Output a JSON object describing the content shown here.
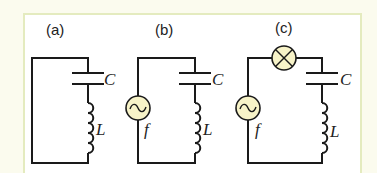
{
  "figure": {
    "background_color": "#fbfbee",
    "panel_border_color": "#e4ebbf",
    "component_fill": "#f7f3c8",
    "wire_color": "#1a1a1a"
  },
  "circuits": [
    {
      "label": "(a)",
      "components": [
        "capacitor",
        "inductor"
      ],
      "capacitor_label": "C",
      "inductor_label": "L"
    },
    {
      "label": "(b)",
      "components": [
        "ac-source",
        "capacitor",
        "inductor"
      ],
      "source_label": "f",
      "capacitor_label": "C",
      "inductor_label": "L"
    },
    {
      "label": "(c)",
      "components": [
        "ac-source",
        "lamp",
        "capacitor",
        "inductor"
      ],
      "source_label": "f",
      "capacitor_label": "C",
      "inductor_label": "L"
    }
  ]
}
